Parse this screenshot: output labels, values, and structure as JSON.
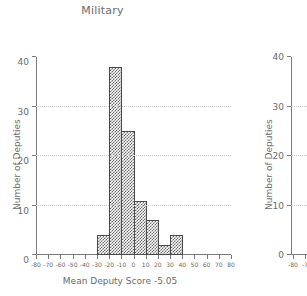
{
  "chart_data": {
    "type": "bar",
    "title": "Military",
    "xlabel": "Mean Deputy Score -5.05",
    "ylabel": "Number of Deputies",
    "mean_deputy_score": -5.05,
    "xlim": [
      -80,
      80
    ],
    "ylim": [
      0,
      40
    ],
    "grid": "horizontal-dotted",
    "legend": "none",
    "bin_width": 10,
    "categories": [
      "-30",
      "-20",
      "-10",
      "0",
      "10",
      "20",
      "30"
    ],
    "bin_starts": [
      -30,
      -20,
      -10,
      0,
      10,
      20,
      30
    ],
    "bin_ends": [
      -20,
      -10,
      0,
      10,
      20,
      30,
      40
    ],
    "values": [
      4,
      38,
      25,
      11,
      7,
      2,
      4
    ],
    "xticks": [
      -80,
      -70,
      -60,
      -50,
      -40,
      -30,
      -20,
      -10,
      0,
      10,
      20,
      30,
      40,
      50,
      60,
      70,
      80
    ],
    "xticklabels": [
      "-80",
      "-70",
      "-60",
      "-50",
      "-40",
      "-30",
      "-20",
      "-10",
      "0",
      "10",
      "20",
      "30",
      "40",
      "50",
      "60",
      "70",
      "80"
    ],
    "yticks": [
      0,
      10,
      20,
      30,
      40
    ],
    "yticklabels": [
      "0",
      "10",
      "20",
      "30",
      "40"
    ],
    "gridlines_at": [
      10,
      20,
      30
    ]
  },
  "right_panel": {
    "ylabel": "Number of Deputies",
    "yticks": [
      0,
      10,
      20,
      30,
      40
    ],
    "yticklabels": [
      "0",
      "10",
      "20",
      "30",
      "40"
    ],
    "gridlines_at": [
      10,
      20,
      30
    ],
    "xticklabels": [
      "-80",
      "-7"
    ],
    "note_truncated": true
  },
  "colors": {
    "bar_fill": "#696969",
    "bar_edge": "#4a4a4a",
    "axis": "#7a7a7a",
    "grid": "#c8c8c8",
    "text": "#6b6b6b",
    "background": "#ffffff"
  }
}
